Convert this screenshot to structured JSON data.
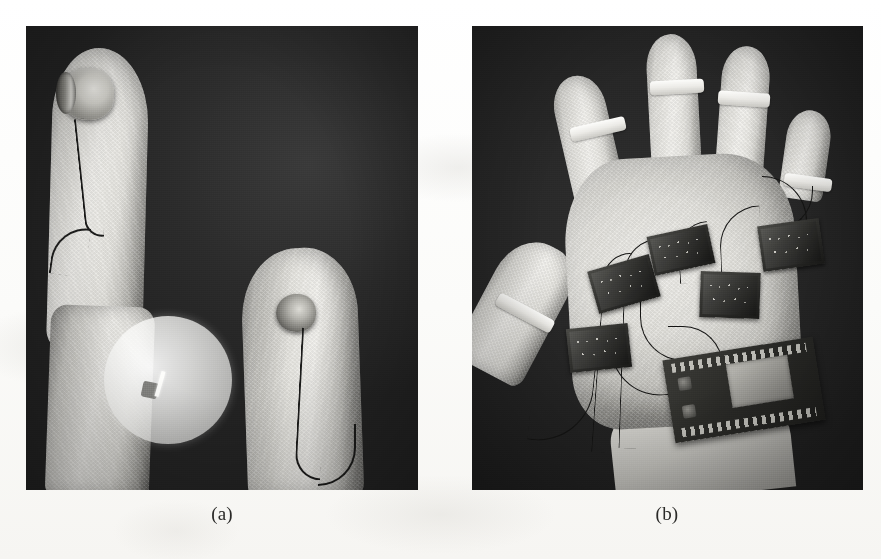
{
  "figure": {
    "type": "scanned-paper-figure",
    "background_color": "#fdfdfc",
    "panel_count": 2,
    "panels": [
      {
        "id": "a",
        "caption": "(a)",
        "subject": "close-up of two fabric-covered fingers each fitted with a round sensor and thin lead wire, shot against a dark background, with a bright circular magnifier overlay highlighting a small sensor element",
        "background_color": "#262626",
        "elements": [
          {
            "name": "finger-upper",
            "description": "white knitted fabric finger sleeve, vertical"
          },
          {
            "name": "sensor-disc-upper",
            "description": "round metallic sensor on fingertip"
          },
          {
            "name": "lead-wire-upper",
            "description": "thin dark wire running down the sleeve"
          },
          {
            "name": "finger-lower",
            "description": "second fabric finger sleeve, angled"
          },
          {
            "name": "sensor-disc-lower",
            "description": "round metallic sensor on second fingertip"
          },
          {
            "name": "lead-wire-lower",
            "description": "thin dark wire curving down"
          },
          {
            "name": "magnifier-overlay",
            "description": "translucent white circular callout highlighting a sensor detail"
          }
        ]
      },
      {
        "id": "b",
        "caption": "(b)",
        "subject": "full sensor glove prototype worn on a hand, back-of-hand view, with five fingertip sleeves, white tape bands, five small sensor breakout PCBs wired across the back of the hand, and a microcontroller development board mounted near the wrist",
        "background_color": "#262626",
        "elements": [
          {
            "name": "glove-palm",
            "description": "white fabric back-of-hand"
          },
          {
            "name": "digit-thumb",
            "description": "thumb sleeve with tape band"
          },
          {
            "name": "digit-index",
            "description": "index finger sleeve with tape band"
          },
          {
            "name": "digit-middle",
            "description": "middle finger sleeve with tape band"
          },
          {
            "name": "digit-ring",
            "description": "ring finger sleeve with tape band"
          },
          {
            "name": "digit-pinky",
            "description": "little finger sleeve with tape band"
          },
          {
            "name": "sensor-board-1",
            "description": "small dark breakout PCB"
          },
          {
            "name": "sensor-board-2",
            "description": "small dark breakout PCB"
          },
          {
            "name": "sensor-board-3",
            "description": "small dark breakout PCB"
          },
          {
            "name": "sensor-board-4",
            "description": "small dark breakout PCB"
          },
          {
            "name": "sensor-board-5",
            "description": "small dark breakout PCB near thumb"
          },
          {
            "name": "microcontroller-board",
            "description": "development board with pin headers and a shielded module, mounted at the wrist"
          },
          {
            "name": "wiring-harness",
            "description": "thin dark wires routed from fingertips to the boards"
          },
          {
            "name": "wrist",
            "description": "bare forearm entering frame at bottom"
          }
        ]
      }
    ]
  }
}
